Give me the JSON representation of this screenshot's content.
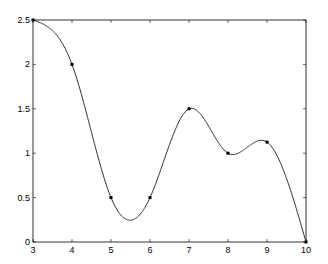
{
  "chart_data": {
    "type": "line",
    "title": "",
    "xlabel": "",
    "ylabel": "",
    "xlim": [
      3,
      10
    ],
    "ylim": [
      0,
      2.5
    ],
    "grid": false,
    "legend": null,
    "x_ticks": [
      "3",
      "4",
      "5",
      "6",
      "7",
      "8",
      "9",
      "10"
    ],
    "y_ticks": [
      "0",
      "0.5",
      "1",
      "1.5",
      "2",
      "2.5"
    ],
    "series": [
      {
        "name": "data points",
        "style": "markers",
        "x": [
          3,
          4,
          5,
          6,
          7,
          8,
          9,
          10
        ],
        "values": [
          2.5,
          2,
          0.5,
          0.5,
          1.5,
          1,
          1.125,
          0
        ]
      },
      {
        "name": "interpolating spline",
        "style": "line",
        "x": [
          3,
          4,
          5,
          6,
          7,
          8,
          9,
          10
        ],
        "values": [
          2.5,
          2,
          0.5,
          0.5,
          1.5,
          1,
          1.125,
          0
        ],
        "annotations": {
          "local_min": [
            5.5,
            0.25
          ]
        }
      }
    ]
  },
  "colors": {
    "axis": "#000000",
    "line": "#333333",
    "marker": "#000000",
    "background": "#ffffff"
  }
}
